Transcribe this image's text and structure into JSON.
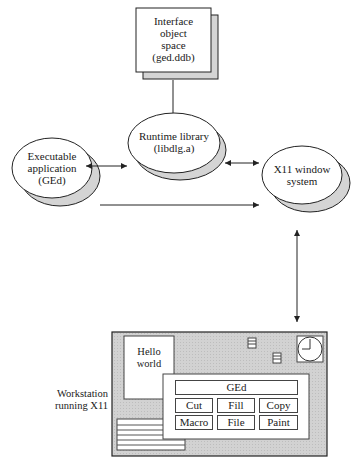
{
  "diagram": {
    "nodes": {
      "interface_space": {
        "lines": [
          "Interface",
          "object",
          "space",
          "(ged.ddb)"
        ]
      },
      "runtime_library": {
        "lines": [
          "Runtime library",
          "(libdlg.a)"
        ]
      },
      "executable_app": {
        "lines": [
          "Executable",
          "application",
          "(GEd)"
        ]
      },
      "x11_system": {
        "lines": [
          "X11 window",
          "system"
        ]
      },
      "workstation": {
        "lines": [
          "Workstation",
          "running X11"
        ]
      }
    },
    "screen": {
      "hello_window": {
        "lines": [
          "Hello",
          "world"
        ]
      },
      "ged_panel": {
        "title": "GEd",
        "buttons": [
          "Cut",
          "Fill",
          "Copy",
          "Macro",
          "File",
          "Paint"
        ]
      }
    },
    "edges": [
      {
        "from": "interface_space",
        "to": "runtime_library",
        "type": "one-way"
      },
      {
        "from": "executable_app",
        "to": "runtime_library",
        "type": "two-way"
      },
      {
        "from": "runtime_library",
        "to": "x11_system",
        "type": "two-way"
      },
      {
        "from": "executable_app",
        "to": "x11_system",
        "type": "one-way"
      },
      {
        "from": "x11_system",
        "to": "workstation",
        "type": "two-way"
      }
    ],
    "colors": {
      "shadow": "#d4d4d4",
      "screen_bg": "#cfcfcf",
      "line": "#222222"
    }
  }
}
